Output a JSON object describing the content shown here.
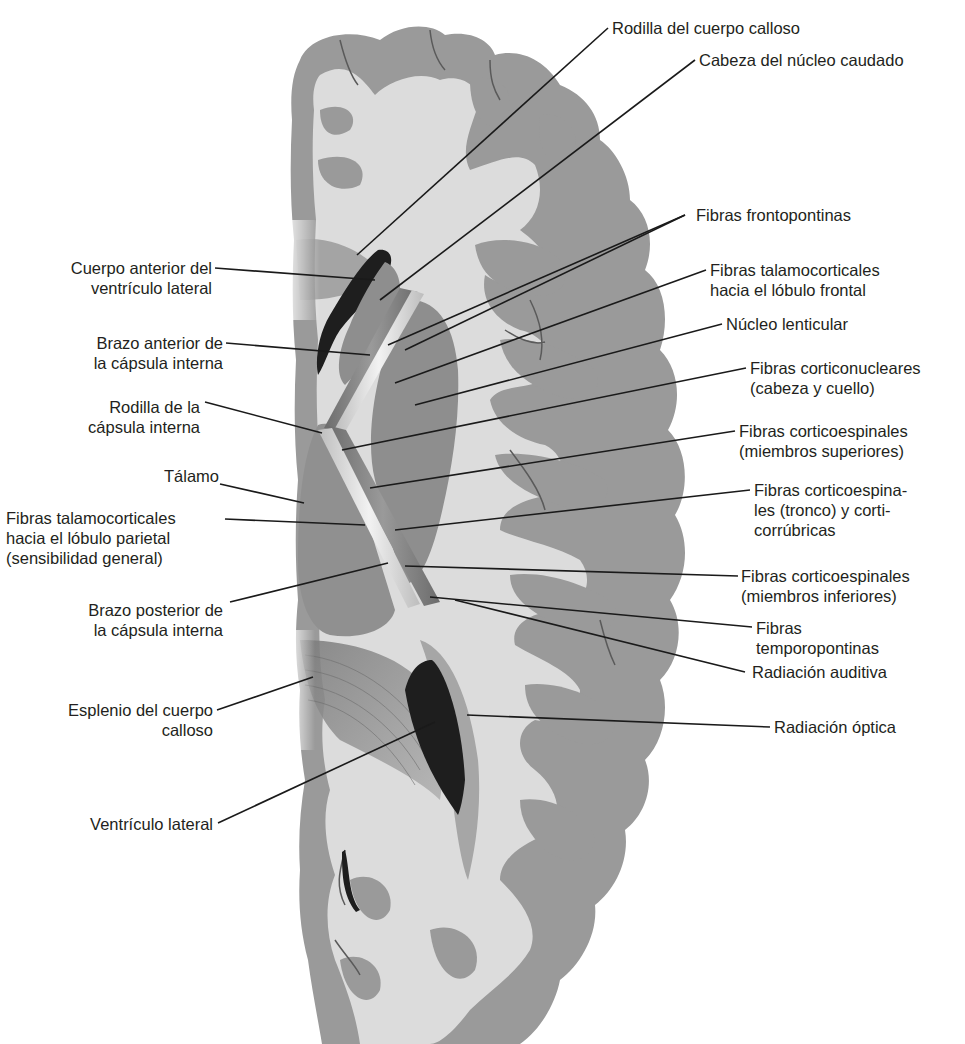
{
  "diagram": {
    "colors": {
      "background": "#ffffff",
      "gray_matter": "#9a9a9a",
      "white_matter": "#dcdcdc",
      "ventricle": "#1e1e1e",
      "fiber_bundle_light": "#e8e8e8",
      "fiber_bundle_dark": "#7c7c7c",
      "leader_line": "#1a1a1a",
      "text": "#231f20"
    },
    "labels_right": [
      {
        "id": "rodilla-cuerpo-calloso",
        "lines": [
          "Rodilla del cuerpo calloso"
        ]
      },
      {
        "id": "cabeza-nucleo-caudado",
        "lines": [
          "Cabeza del núcleo caudado"
        ]
      },
      {
        "id": "fibras-frontopontinas",
        "lines": [
          "Fibras frontopontinas"
        ]
      },
      {
        "id": "fibras-talamocorticales-frontal",
        "lines": [
          "Fibras talamocorticales",
          "hacia el lóbulo frontal"
        ]
      },
      {
        "id": "nucleo-lenticular",
        "lines": [
          "Núcleo lenticular"
        ]
      },
      {
        "id": "fibras-corticonucleares",
        "lines": [
          "Fibras corticonucleares",
          "(cabeza y cuello)"
        ]
      },
      {
        "id": "fibras-corticoespinales-superiores",
        "lines": [
          "Fibras corticoespinales",
          "(miembros superiores)"
        ]
      },
      {
        "id": "fibras-corticoespinales-tronco",
        "lines": [
          "Fibras corticoespina-",
          "les (tronco) y corti-",
          "corrúbricas"
        ]
      },
      {
        "id": "fibras-corticoespinales-inferiores",
        "lines": [
          "Fibras corticoespinales",
          "(miembros inferiores)"
        ]
      },
      {
        "id": "fibras-temporopontinas",
        "lines": [
          "Fibras",
          "temporopontinas"
        ]
      },
      {
        "id": "radiacion-auditiva",
        "lines": [
          "Radiación auditiva"
        ]
      },
      {
        "id": "radiacion-optica",
        "lines": [
          "Radiación óptica"
        ]
      }
    ],
    "labels_left": [
      {
        "id": "cuerpo-anterior-ventriculo",
        "lines": [
          "Cuerpo anterior del",
          "ventrículo lateral"
        ]
      },
      {
        "id": "brazo-anterior-capsula",
        "lines": [
          "Brazo anterior de",
          "la cápsula interna"
        ]
      },
      {
        "id": "rodilla-capsula",
        "lines": [
          "Rodilla de la",
          "cápsula interna"
        ]
      },
      {
        "id": "talamo",
        "lines": [
          "Tálamo"
        ]
      },
      {
        "id": "fibras-talamocorticales-parietal",
        "lines": [
          "Fibras talamocorticales",
          "hacia el lóbulo parietal",
          "(sensibilidad general)"
        ]
      },
      {
        "id": "brazo-posterior-capsula",
        "lines": [
          "Brazo posterior de",
          "la cápsula interna"
        ]
      },
      {
        "id": "esplenio-cuerpo-calloso",
        "lines": [
          "Esplenio del cuerpo",
          "calloso"
        ]
      },
      {
        "id": "ventriculo-lateral",
        "lines": [
          "Ventrículo lateral"
        ]
      }
    ]
  }
}
